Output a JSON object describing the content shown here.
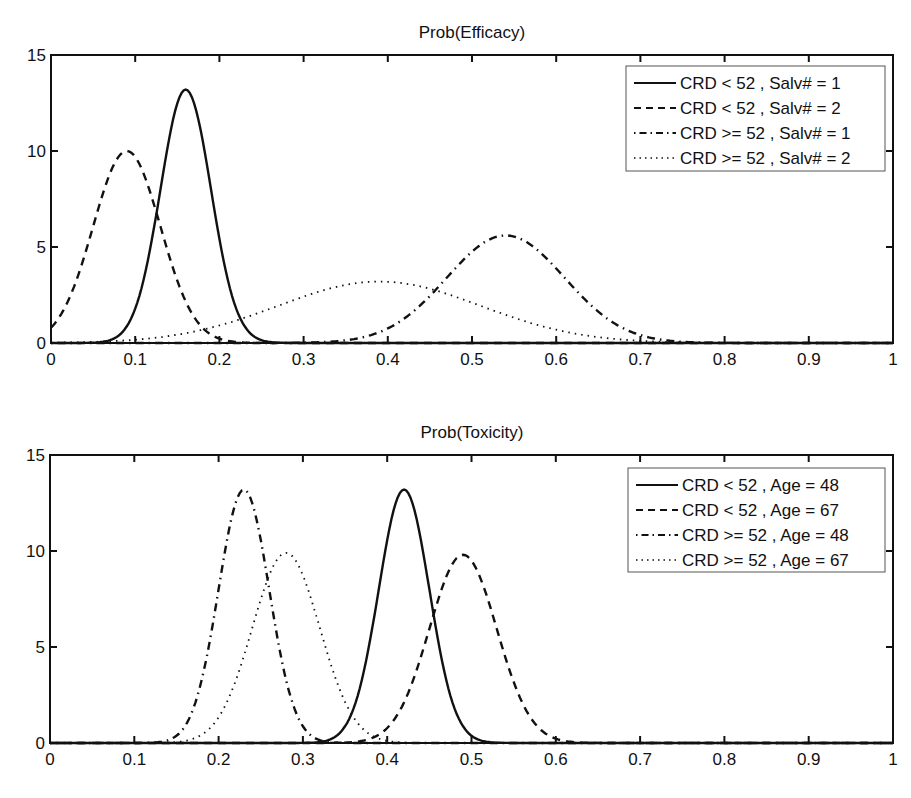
{
  "chart_data": [
    {
      "type": "line",
      "title": "Prob(Efficacy)",
      "xlabel": "",
      "ylabel": "",
      "xlim": [
        0,
        1
      ],
      "ylim": [
        0,
        15
      ],
      "xticks": [
        "0",
        "0.1",
        "0.2",
        "0.3",
        "0.4",
        "0.5",
        "0.6",
        "0.7",
        "0.8",
        "0.9",
        "1"
      ],
      "yticks": [
        "0",
        "5",
        "10",
        "15"
      ],
      "grid": false,
      "legend_position": "upper right",
      "series": [
        {
          "name": "CRD < 52 , Salv# = 1",
          "style": "solid",
          "peak_x": 0.16,
          "peak_y": 13.2,
          "sigma": 0.03
        },
        {
          "name": "CRD < 52 , Salv# = 2",
          "style": "dashed",
          "peak_x": 0.09,
          "peak_y": 10.0,
          "sigma": 0.04
        },
        {
          "name": "CRD >= 52 , Salv# = 1",
          "style": "dashdot",
          "peak_x": 0.54,
          "peak_y": 5.6,
          "sigma": 0.07
        },
        {
          "name": "CRD >= 52 , Salv# = 2",
          "style": "dotted",
          "peak_x": 0.39,
          "peak_y": 3.2,
          "sigma": 0.12
        }
      ]
    },
    {
      "type": "line",
      "title": "Prob(Toxicity)",
      "xlabel": "",
      "ylabel": "",
      "xlim": [
        0,
        1
      ],
      "ylim": [
        0,
        15
      ],
      "xticks": [
        "0",
        "0.1",
        "0.2",
        "0.3",
        "0.4",
        "0.5",
        "0.6",
        "0.7",
        "0.8",
        "0.9",
        "1"
      ],
      "yticks": [
        "0",
        "5",
        "10",
        "15"
      ],
      "grid": false,
      "legend_position": "upper right",
      "series": [
        {
          "name": "CRD < 52 , Age = 48",
          "style": "solid",
          "peak_x": 0.42,
          "peak_y": 13.2,
          "sigma": 0.03
        },
        {
          "name": "CRD < 52 , Age = 67",
          "style": "dashed",
          "peak_x": 0.49,
          "peak_y": 9.8,
          "sigma": 0.04
        },
        {
          "name": "CRD >= 52 , Age = 48",
          "style": "dashdot",
          "peak_x": 0.23,
          "peak_y": 13.2,
          "sigma": 0.03
        },
        {
          "name": "CRD >= 52 , Age = 67",
          "style": "dotted",
          "peak_x": 0.28,
          "peak_y": 9.9,
          "sigma": 0.04
        }
      ]
    }
  ],
  "colors": {
    "line": "#111111",
    "axes": "#111111",
    "legend_border": "#555555",
    "background": "#ffffff"
  }
}
